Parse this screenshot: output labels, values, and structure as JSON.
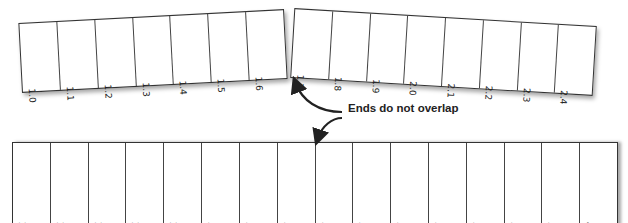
{
  "strips": {
    "top_left": {
      "labels": [
        "1.0",
        "1.1",
        "1.2",
        "1.3",
        "1.4",
        "1.5",
        "1.6"
      ]
    },
    "top_right": {
      "labels": [
        "1.7",
        "1.8",
        "1.9",
        "2.0",
        "2.1",
        "2.2",
        "2.3",
        "2.4"
      ]
    },
    "bottom": {
      "labels": [
        "2.5",
        "2.6",
        "2.7",
        "2.8",
        "2.9",
        "3.0",
        "3.1",
        "3.2",
        "3.3",
        "3.4",
        "3.5",
        "3.6",
        "3.7",
        "3.8",
        "3.9",
        "4.0"
      ]
    }
  },
  "annotation": {
    "text": "Ends do not overlap"
  }
}
